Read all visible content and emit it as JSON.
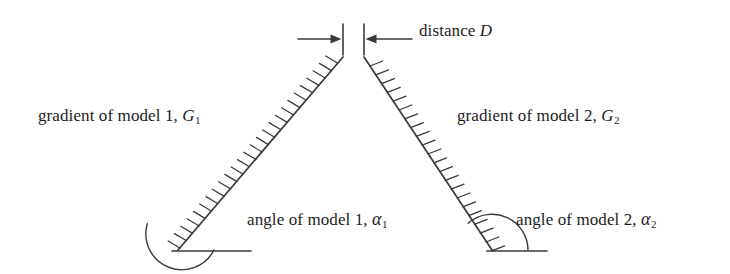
{
  "figure": {
    "background_color": "#ffffff",
    "line_color": "#3a3a3a",
    "text_color": "#1d1d1d"
  },
  "labels": {
    "distance": {
      "prefix": "distance",
      "symbol": "D",
      "full": "distance D"
    },
    "gradient_model_1": {
      "prefix": "gradient of model 1,",
      "symbol": "G",
      "subscript": "1",
      "full": "gradient of model 1, G1"
    },
    "gradient_model_2": {
      "prefix": "gradient of model 2,",
      "symbol": "G",
      "subscript": "2",
      "full": "gradient of model 2, G2"
    },
    "angle_model_1": {
      "prefix": "angle of model 1,",
      "symbol": "α",
      "subscript": "1",
      "full": "angle of model 1, α1"
    },
    "angle_model_2": {
      "prefix": "angle of model 2,",
      "symbol": "α",
      "subscript": "2",
      "full": "angle of model 2, α2"
    }
  },
  "diagram_data": {
    "type": "schematic",
    "slopes": [
      {
        "name": "model-1-slope",
        "top": [
          343,
          57
        ],
        "bottom": [
          178,
          250
        ],
        "hatch_side": "left",
        "hatch_count": 26
      },
      {
        "name": "model-2-slope",
        "top": [
          364,
          57
        ],
        "bottom": [
          492,
          250
        ],
        "hatch_side": "right",
        "hatch_count": 22
      }
    ],
    "baselines": [
      {
        "name": "model-1-baseline",
        "from": [
          172,
          251
        ],
        "to": [
          251,
          251
        ]
      },
      {
        "name": "model-2-baseline",
        "from": [
          487,
          251
        ],
        "to": [
          547,
          251
        ]
      }
    ],
    "angle_arcs": [
      {
        "name": "model-1-angle-arc",
        "vertex": [
          178,
          250
        ],
        "radius": 36
      },
      {
        "name": "model-2-angle-arc",
        "vertex": [
          492,
          250
        ],
        "radius": 36
      }
    ],
    "distance_markers": {
      "tick_left_x": 343,
      "tick_right_x": 364,
      "tick_top_y": 24,
      "tick_bottom_y": 54,
      "arrow_left": {
        "from": [
          298,
          39
        ],
        "to": [
          340,
          39
        ]
      },
      "arrow_right": {
        "from": [
          410,
          39
        ],
        "to": [
          368,
          39
        ]
      }
    }
  }
}
